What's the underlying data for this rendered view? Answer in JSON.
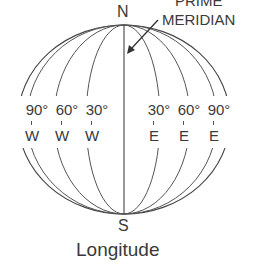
{
  "diagram": {
    "title": "Longitude",
    "poles": {
      "north": "N",
      "south": "S"
    },
    "annotation": {
      "line1": "PRIME",
      "line2": "MERIDIAN"
    },
    "meridian_labels": [
      {
        "degrees": "90°",
        "direction": "W"
      },
      {
        "degrees": "60°",
        "direction": "W"
      },
      {
        "degrees": "30°",
        "direction": "W"
      },
      {
        "degrees": "30°",
        "direction": "E"
      },
      {
        "degrees": "60°",
        "direction": "E"
      },
      {
        "degrees": "90°",
        "direction": "E"
      }
    ],
    "colors": {
      "line": "#444444",
      "text": "#3a3a3a",
      "background": "#ffffff"
    }
  }
}
